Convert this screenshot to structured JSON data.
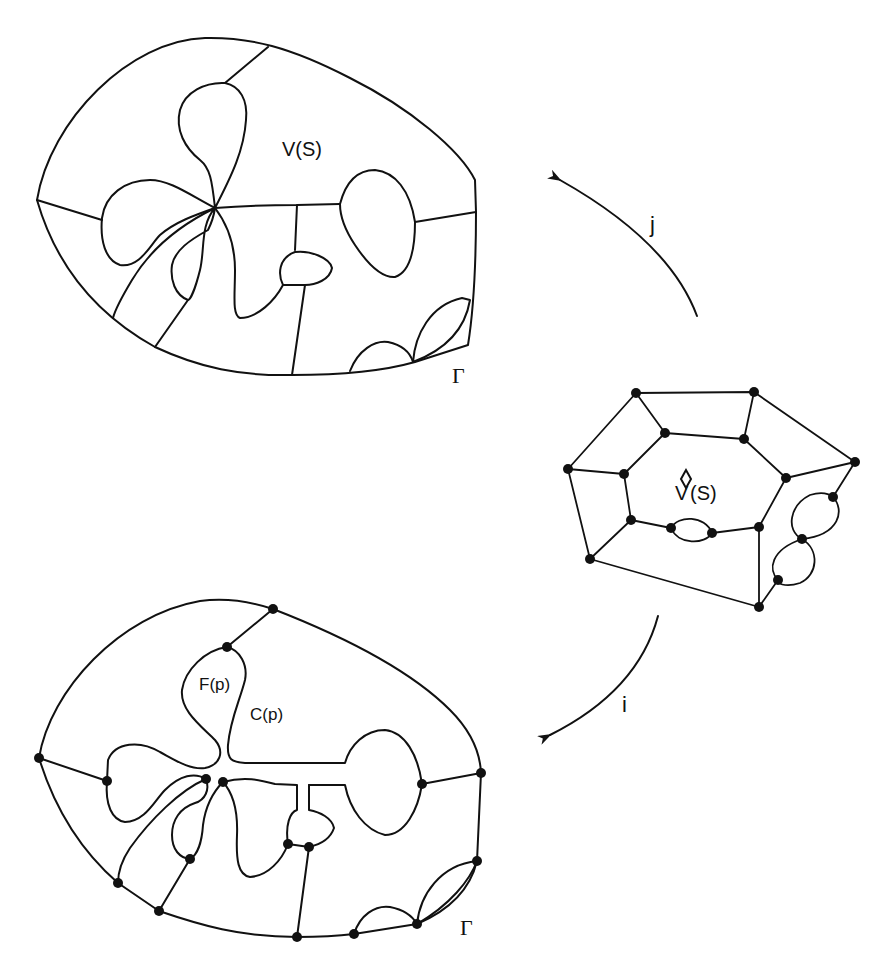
{
  "figure": {
    "colors": {
      "ink": "#111111",
      "background": "#ffffff"
    },
    "top_diagram": {
      "region_label": "V(S)",
      "boundary_label": "Γ"
    },
    "middle_diagram": {
      "region_label_hat": "V̂(S)",
      "region_label_base": "V",
      "region_label_rest": "(S)"
    },
    "bottom_diagram": {
      "face_label": "F(p)",
      "cell_label": "C(p)",
      "boundary_label": "Γ"
    },
    "arrows": {
      "upper": {
        "label": "j",
        "direction": "from middle graph to top diagram"
      },
      "lower": {
        "label": "i",
        "direction": "from middle graph to bottom diagram"
      }
    }
  }
}
